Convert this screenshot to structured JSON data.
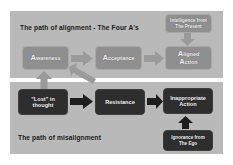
{
  "diagram": {
    "title_alignment": "The path of alignment - The Four A's",
    "title_misalignment": "The path of misalignment",
    "colors": {
      "page_background": "#ffffff",
      "panel_background": "#b9b9b9",
      "node_light": "#8f8f8f",
      "node_dark": "#2e2e2e",
      "node_text": "#f2f2f2",
      "caption_text": "#1b1b1b",
      "arrow_light": "#9a9a9a",
      "arrow_dark": "#1e1e1e"
    },
    "alignment_path": {
      "caption": "The path of alignment - The Four A's",
      "nodes": [
        {
          "id": "awareness",
          "initial": "A",
          "rest": "wareness",
          "label": "Awareness"
        },
        {
          "id": "acceptance",
          "initial": "A",
          "rest": "cceptance",
          "label": "Acceptance"
        },
        {
          "id": "aligned-action",
          "initial_1": "A",
          "rest_1": "ligned",
          "initial_2": "A",
          "rest_2": "ction",
          "label": "Aligned Action"
        }
      ],
      "source_node": {
        "id": "intelligence",
        "line1": "Intelligence from",
        "line2": "The Present"
      }
    },
    "misalignment_path": {
      "caption": "The path of misalignment",
      "nodes": [
        {
          "id": "lost-in-thought",
          "line1": "\"Lost\" in",
          "line2": "thought"
        },
        {
          "id": "resistance",
          "line1": "Resistance",
          "line2": ""
        },
        {
          "id": "inappropriate-action",
          "line1": "Inappropriate",
          "line2": "Action"
        }
      ],
      "source_node": {
        "id": "ignorance",
        "line1": "Ignorance from",
        "line2": "The Ego"
      }
    },
    "arrows": [
      {
        "id": "awareness-to-acceptance",
        "direction": "right"
      },
      {
        "id": "acceptance-to-aligned",
        "direction": "right"
      },
      {
        "id": "lost-to-resistance",
        "direction": "right"
      },
      {
        "id": "resistance-to-inappropriate",
        "direction": "right"
      },
      {
        "id": "intelligence-to-aligned",
        "direction": "down"
      },
      {
        "id": "ignorance-to-inappropriate",
        "direction": "up"
      },
      {
        "id": "lost-to-awareness",
        "direction": "up"
      },
      {
        "id": "resistance-to-awareness",
        "direction": "up-left-diagonal"
      }
    ]
  }
}
